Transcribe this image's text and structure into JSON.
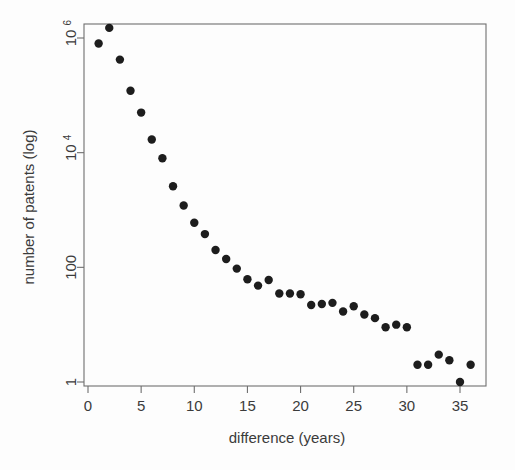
{
  "chart_data": {
    "type": "scatter",
    "title": "",
    "xlabel": "difference (years)",
    "ylabel": "number of patents (log)",
    "x": [
      1,
      2,
      3,
      4,
      5,
      6,
      7,
      8,
      9,
      10,
      11,
      12,
      13,
      14,
      15,
      16,
      17,
      18,
      19,
      20,
      21,
      22,
      23,
      24,
      25,
      26,
      27,
      28,
      29,
      30,
      31,
      32,
      33,
      34,
      35,
      36
    ],
    "values": [
      800000,
      1500000,
      420000,
      120000,
      50000,
      17000,
      8000,
      2600,
      1200,
      600,
      380,
      200,
      140,
      95,
      62,
      48,
      60,
      35,
      35,
      34,
      22,
      23,
      24,
      17,
      21,
      15,
      13,
      9,
      10,
      9,
      2,
      2,
      3,
      2.4,
      1,
      2
    ],
    "xlim": [
      0,
      36.6
    ],
    "ylim": [
      1,
      3000000
    ],
    "yscale": "log",
    "xticks": [
      0,
      5,
      10,
      15,
      20,
      25,
      30,
      35
    ],
    "xtick_labels": [
      "0",
      "5",
      "10",
      "15",
      "20",
      "25",
      "30",
      "35"
    ],
    "yticks": [
      1,
      100,
      10000,
      1000000
    ],
    "ytick_labels": [
      "1",
      "100",
      "10",
      "10"
    ],
    "ytick_label_parts": [
      {
        "base": "1",
        "exp": ""
      },
      {
        "base": "100",
        "exp": ""
      },
      {
        "base": "10",
        "exp": "4"
      },
      {
        "base": "10",
        "exp": "6"
      }
    ],
    "grid": false,
    "legend": null,
    "marker": "filled-circle",
    "marker_color": "#1d1d1d",
    "marker_size": 4.2,
    "axis_color": "#6f6f6f",
    "background": "#fdfdfd"
  },
  "axes": {
    "x_title": "difference (years)",
    "y_title": "number of patents (log)"
  }
}
